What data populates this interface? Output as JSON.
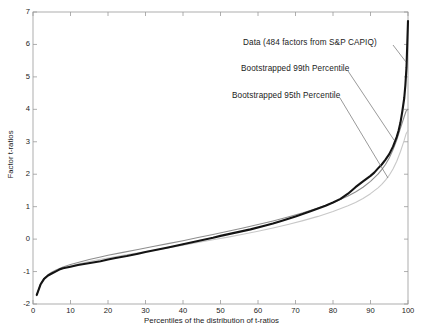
{
  "chart_data": {
    "type": "line",
    "title": "",
    "xlabel": "Percentiles of the distribution of t-ratios",
    "ylabel": "Factor t-ratios",
    "xlim": [
      0,
      100
    ],
    "ylim": [
      -2,
      7
    ],
    "xticks": [
      0,
      10,
      20,
      30,
      40,
      50,
      60,
      70,
      80,
      90,
      100
    ],
    "yticks": [
      -2,
      -1,
      0,
      1,
      2,
      3,
      4,
      5,
      6,
      7
    ],
    "grid": false,
    "legend_position": "inline-annotations",
    "series": [
      {
        "name": "Data (484 factors from S&P CAPIQ)",
        "color": "#141414",
        "width": 2.1,
        "x": [
          1,
          2,
          3,
          4,
          5,
          6,
          7,
          8,
          10,
          12,
          14,
          16,
          18,
          20,
          22,
          25,
          28,
          30,
          33,
          36,
          40,
          44,
          48,
          50,
          54,
          58,
          62,
          64,
          66,
          70,
          74,
          78,
          80,
          82,
          84,
          85,
          86,
          88,
          90,
          91,
          92,
          93,
          94,
          95,
          96,
          97,
          97.5,
          98,
          98.5,
          99,
          99.3,
          99.6,
          99.8,
          100
        ],
        "y": [
          -1.72,
          -1.4,
          -1.22,
          -1.12,
          -1.06,
          -1.0,
          -0.94,
          -0.9,
          -0.85,
          -0.8,
          -0.76,
          -0.72,
          -0.68,
          -0.63,
          -0.58,
          -0.52,
          -0.45,
          -0.4,
          -0.33,
          -0.26,
          -0.16,
          -0.06,
          0.04,
          0.1,
          0.2,
          0.3,
          0.42,
          0.48,
          0.55,
          0.7,
          0.86,
          1.03,
          1.13,
          1.24,
          1.4,
          1.5,
          1.6,
          1.78,
          1.95,
          2.05,
          2.18,
          2.3,
          2.45,
          2.62,
          2.85,
          3.15,
          3.35,
          3.6,
          3.95,
          4.35,
          4.75,
          5.3,
          6.0,
          6.72
        ]
      },
      {
        "name": "Bootstrapped 99th Percentile",
        "color": "#8e8e8e",
        "width": 1.1,
        "x": [
          1,
          2,
          3,
          4,
          5,
          6,
          8,
          10,
          12,
          15,
          18,
          20,
          24,
          28,
          32,
          36,
          40,
          44,
          48,
          52,
          56,
          60,
          64,
          68,
          72,
          76,
          80,
          84,
          86,
          88,
          90,
          92,
          93,
          94,
          95,
          96,
          97,
          98,
          99,
          99.5,
          100
        ],
        "y": [
          -1.72,
          -1.38,
          -1.2,
          -1.1,
          -1.02,
          -0.96,
          -0.86,
          -0.78,
          -0.72,
          -0.63,
          -0.55,
          -0.5,
          -0.41,
          -0.32,
          -0.23,
          -0.14,
          -0.05,
          0.05,
          0.14,
          0.24,
          0.34,
          0.45,
          0.56,
          0.68,
          0.81,
          0.96,
          1.12,
          1.33,
          1.45,
          1.6,
          1.78,
          2.0,
          2.14,
          2.3,
          2.5,
          2.75,
          3.05,
          3.42,
          3.78,
          3.95,
          4.0
        ]
      },
      {
        "name": "Bootstrapped 95th Percentile",
        "color": "#c8c8c8",
        "width": 1.1,
        "x": [
          1,
          2,
          3,
          4,
          5,
          6,
          8,
          10,
          12,
          15,
          18,
          20,
          24,
          28,
          32,
          36,
          40,
          44,
          48,
          52,
          56,
          60,
          64,
          68,
          72,
          76,
          80,
          84,
          86,
          88,
          90,
          92,
          93,
          94,
          95,
          96,
          97,
          98,
          99,
          99.5,
          100
        ],
        "y": [
          -1.75,
          -1.42,
          -1.24,
          -1.14,
          -1.06,
          -1.0,
          -0.9,
          -0.83,
          -0.77,
          -0.69,
          -0.62,
          -0.58,
          -0.5,
          -0.42,
          -0.35,
          -0.27,
          -0.19,
          -0.1,
          -0.02,
          0.06,
          0.15,
          0.24,
          0.34,
          0.45,
          0.57,
          0.7,
          0.85,
          1.03,
          1.13,
          1.25,
          1.4,
          1.58,
          1.69,
          1.82,
          1.97,
          2.16,
          2.4,
          2.7,
          3.05,
          3.25,
          3.35
        ]
      }
    ],
    "annotations": [
      {
        "id": "data",
        "text": "Data (484 factors from S&P CAPIQ)",
        "leader_from": [
          393,
          45
        ],
        "leader_to": [
          406,
          62
        ]
      },
      {
        "id": "p99",
        "text": "Bootstrapped 99th Percentile",
        "leader_from": [
          348,
          71
        ],
        "leader_to": [
          394,
          140
        ]
      },
      {
        "id": "p95",
        "text": "Bootstrapped 95th Percentile",
        "leader_from": [
          340,
          98
        ],
        "leader_to": [
          388,
          178
        ]
      }
    ]
  },
  "axes": {
    "xlabel": "Percentiles of the distribution of t-ratios",
    "ylabel": "Factor t-ratios",
    "xtick_labels": [
      "0",
      "10",
      "20",
      "30",
      "40",
      "50",
      "60",
      "70",
      "80",
      "90",
      "100"
    ],
    "ytick_labels": [
      "-2",
      "-1",
      "0",
      "1",
      "2",
      "3",
      "4",
      "5",
      "6",
      "7"
    ]
  },
  "colors": {
    "data_line": "#141414",
    "p99_line": "#8e8e8e",
    "p95_line": "#c8c8c8",
    "axis": "#9a9a9a",
    "text": "#1b1b1b",
    "background": "#ffffff"
  }
}
